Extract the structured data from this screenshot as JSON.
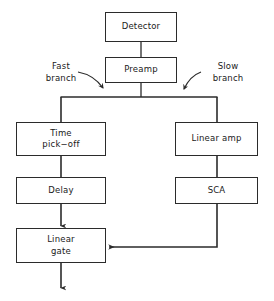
{
  "diagram": {
    "stroke_color": "#2b2b2b",
    "text_color": "#1a1a1a",
    "background_color": "#ffffff",
    "nodes": [
      {
        "id": "detector",
        "label": "Detector",
        "x": 105,
        "y": 12,
        "w": 72,
        "h": 30
      },
      {
        "id": "preamp",
        "label": "Preamp",
        "x": 105,
        "y": 57,
        "w": 72,
        "h": 26
      },
      {
        "id": "time-pickoff",
        "label": "Time\npick−off",
        "x": 16,
        "y": 122,
        "w": 90,
        "h": 34
      },
      {
        "id": "linear-amp",
        "label": "Linear amp",
        "x": 175,
        "y": 122,
        "w": 83,
        "h": 34
      },
      {
        "id": "delay",
        "label": "Delay",
        "x": 16,
        "y": 177,
        "w": 90,
        "h": 27
      },
      {
        "id": "sca",
        "label": "SCA",
        "x": 175,
        "y": 177,
        "w": 83,
        "h": 27
      },
      {
        "id": "linear-gate",
        "label": "Linear\ngate",
        "x": 16,
        "y": 228,
        "w": 90,
        "h": 35
      }
    ],
    "branch_labels": [
      {
        "id": "fast-branch",
        "label": "Fast\nbranch",
        "x": 38,
        "y": 61,
        "w": 46
      },
      {
        "id": "slow-branch",
        "label": "Slow\nbranch",
        "x": 205,
        "y": 61,
        "w": 46
      }
    ]
  }
}
